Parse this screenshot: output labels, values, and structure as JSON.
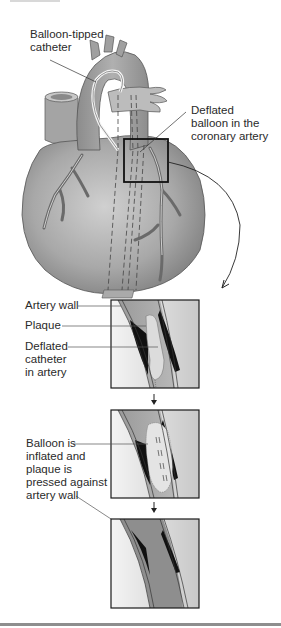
{
  "figure": {
    "heart_illustration": {
      "labels": {
        "catheter": "Balloon-tipped\ncatheter",
        "deflated_balloon": "Deflated\nballoon in the\ncoronary artery"
      }
    },
    "panels": [
      {
        "step": 1,
        "labels": {
          "artery_wall": "Artery wall",
          "plaque": "Plaque",
          "catheter": "Deflated\ncatheter\nin artery"
        }
      },
      {
        "step": 2,
        "labels": {
          "balloon": "Balloon is\ninflated and\nplaque is\npressed against\nartery wall"
        }
      },
      {
        "step": 3,
        "labels": {}
      }
    ],
    "colors": {
      "heart_fill": "#9a9a9a",
      "heart_light": "#c4c4c4",
      "artery_dark": "#6e6e6e",
      "plaque": "#dcdcdc",
      "lumen_dark": "#111111",
      "frame": "#1a1a1a"
    }
  }
}
